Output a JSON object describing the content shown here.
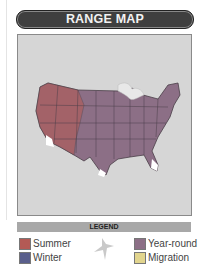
{
  "header": {
    "title": "RANGE MAP"
  },
  "map": {
    "region": "United States",
    "background": "#d6d6d6"
  },
  "legend": {
    "title": "LEGEND",
    "items": [
      {
        "label": "Summer",
        "color": "#b35a55"
      },
      {
        "label": "Winter",
        "color": "#5a5f8c"
      },
      {
        "label": "Year-round",
        "color": "#8c6f86"
      },
      {
        "label": "Migration",
        "color": "#e2d58e"
      }
    ]
  },
  "icons": {
    "bird": "bird-silhouette-icon"
  }
}
